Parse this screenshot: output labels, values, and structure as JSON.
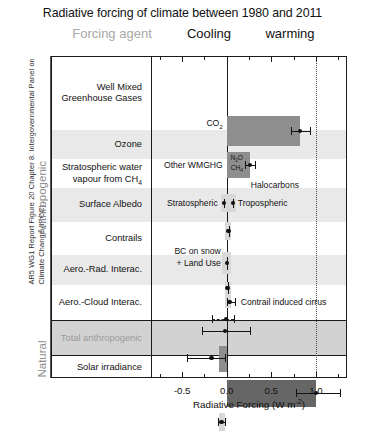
{
  "caption": "AR5 WG1 Report Figure 20 Chapter 8. Intergovernmental Panel on Climate Change (IPCC).",
  "title": "Radiative forcing of climate between 1980 and 2011",
  "header": {
    "agent": "Forcing agent",
    "cooling": "Cooling",
    "warming": "warming",
    "agent_color": "#a8a8a8"
  },
  "groups": [
    {
      "label": "Anthropogenic"
    },
    {
      "label": "Natural"
    }
  ],
  "axis": {
    "title_main": "Radiative Forcing (W m",
    "title_sup": "-2",
    "title_end": ")",
    "tick_labels": [
      "-0.5",
      "0.0",
      "0.5",
      "1.0"
    ],
    "tick_values": [
      -0.5,
      0,
      0.5,
      1.0
    ],
    "minor_step": 0.25,
    "xmin": -0.85,
    "xmax": 1.35,
    "reference_line": 1.0
  },
  "rows": [
    {
      "label": "Well Mixed\nGreenhouse Gases",
      "shaded": false
    },
    {
      "label": "Ozone",
      "shaded": true
    },
    {
      "label": "Stratospheric water\nvapour from CH4",
      "shaded": false
    },
    {
      "label": "Surface Albedo",
      "shaded": true
    },
    {
      "label": "Contrails",
      "shaded": false
    },
    {
      "label": "Aero.-Rad. Interac.",
      "shaded": true
    },
    {
      "label": "Aero.-Cloud Interac.",
      "shaded": false
    },
    {
      "label": "Total anthropogenic",
      "shaded": false,
      "total": true
    },
    {
      "label": "Solar irradiance",
      "shaded": false
    }
  ],
  "annotations": {
    "co2": "CO2",
    "other_wmghg": "Other WMGHG",
    "halocarbons": "Halocarbons",
    "n2o": "N2O",
    "ch4": "CH4",
    "stratospheric": "Stratospheric",
    "tropospheric": "Tropospheric",
    "bc_on_snow": "BC on snow",
    "land_use": "+ Land Use",
    "contrail_cirrus": "Contrail induced cirrus"
  },
  "chart_data": {
    "type": "bar",
    "title": "Radiative forcing of climate between 1980 and 2011",
    "xlabel": "Radiative Forcing (W m-2)",
    "ylabel": "Forcing agent",
    "xlim": [
      -0.85,
      1.35
    ],
    "orientation": "horizontal",
    "grid": false,
    "legend": "none",
    "reference_lines": [
      0.0,
      1.0
    ],
    "units": "W m-2",
    "period": "1980 to 2011",
    "items": [
      {
        "name": "CO2",
        "group": "Well Mixed Greenhouse Gases",
        "value": 0.82,
        "bar_start": 0.0,
        "bar_end": 0.82,
        "err_low": 0.72,
        "err_high": 0.94,
        "bar_color": "#8e8e8e"
      },
      {
        "name": "Other WMGHG",
        "group": "Well Mixed Greenhouse Gases",
        "value": 0.26,
        "bar_start": 0.0,
        "bar_end": 0.26,
        "err_low": 0.21,
        "err_high": 0.32,
        "bar_color": "#8e8e8e",
        "components": [
          "N2O",
          "CH4",
          "Halocarbons"
        ]
      },
      {
        "name": "Stratospheric ozone",
        "group": "Ozone",
        "value": -0.03,
        "err_low": -0.09,
        "err_high": 0.03,
        "bar_color": "#d8d8d8"
      },
      {
        "name": "Tropospheric ozone",
        "group": "Ozone",
        "value": 0.07,
        "err_low": 0.02,
        "err_high": 0.13,
        "bar_color": "#d8d8d8"
      },
      {
        "name": "Stratospheric water vapour from CH4",
        "group": "Stratospheric water vapour",
        "value": 0.02,
        "err_low": -0.01,
        "err_high": 0.05,
        "bar_color": "#d8d8d8"
      },
      {
        "name": "Surface Albedo (BC on snow + Land Use)",
        "group": "Surface Albedo",
        "value": 0.0,
        "err_low": -0.06,
        "err_high": 0.06,
        "bar_color": "#d8d8d8"
      },
      {
        "name": "Contrails",
        "group": "Contrails",
        "value": 0.01,
        "err_low": 0.0,
        "err_high": 0.02,
        "bar_color": "#d8d8d8"
      },
      {
        "name": "Contrail induced cirrus",
        "group": "Contrails",
        "value": 0.03,
        "err_low": 0.0,
        "err_high": 0.09,
        "bar_color": "#d8d8d8"
      },
      {
        "name": "Aerosol-Radiation Interactions",
        "group": "Aero.-Rad. Interac.",
        "value": -0.01,
        "err_low": -0.17,
        "err_high": 0.08,
        "bar_color": "#d8d8d8",
        "style": "dashed"
      },
      {
        "name": "Aerosol-Radiation Interactions (total)",
        "group": "Aero.-Rad. Interac.",
        "value": -0.02,
        "err_low": -0.28,
        "err_high": 0.26,
        "bar_color": "#d8d8d8"
      },
      {
        "name": "Aerosol-Cloud Interactions",
        "group": "Aero.-Cloud Interac.",
        "value": -0.17,
        "bar_start": -0.09,
        "bar_end": 0.0,
        "err_low": -0.45,
        "err_high": -0.02,
        "bar_color": "#9a9a9a"
      },
      {
        "name": "Total anthropogenic",
        "group": "Total anthropogenic",
        "value": 1.0,
        "bar_start": 0.0,
        "bar_end": 1.0,
        "err_low": 0.78,
        "err_high": 1.27,
        "bar_color": "#666666"
      },
      {
        "name": "Solar irradiance",
        "group": "Natural",
        "value": -0.06,
        "err_low": -0.1,
        "err_high": -0.02,
        "bar_color": "#d8d8d8"
      }
    ]
  }
}
